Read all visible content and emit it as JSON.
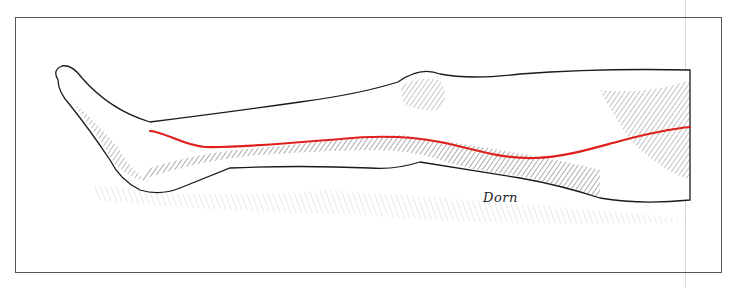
{
  "illustration": {
    "subject": "leg-lateral-view",
    "signature": "Dorn",
    "colors": {
      "ink": "#1a1a1a",
      "marker_line": "#e0201c",
      "frame": "#555555",
      "background": "#ffffff"
    },
    "marker_path_points": [
      [
        150,
        131
      ],
      [
        200,
        147
      ],
      [
        300,
        142
      ],
      [
        380,
        136
      ],
      [
        440,
        142
      ],
      [
        530,
        158
      ],
      [
        600,
        147
      ],
      [
        690,
        127
      ]
    ]
  }
}
